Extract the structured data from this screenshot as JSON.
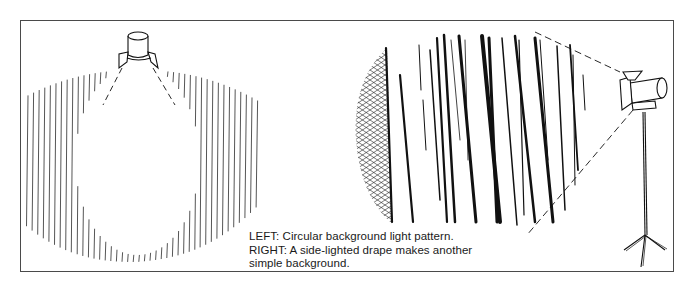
{
  "figure": {
    "caption": {
      "line1": "LEFT: Circular background light pattern.",
      "line2": "RIGHT: A side-lighted drape makes another",
      "line3": "simple background."
    },
    "left_panel": {
      "subject": "circular-background-light-pattern",
      "light_fixture": "overhead-spotlight-with-barn-doors",
      "hatch": "vertical-lines",
      "ink_color": "#2a2a2a"
    },
    "right_panel": {
      "subject": "side-lighted-drape",
      "light_fixture": "spotlight-on-tripod-stand",
      "hatch": "crosshatch-shadow-and-heavy-folds",
      "ink_color": "#111111"
    },
    "frame_color": "#4a4a4a"
  }
}
